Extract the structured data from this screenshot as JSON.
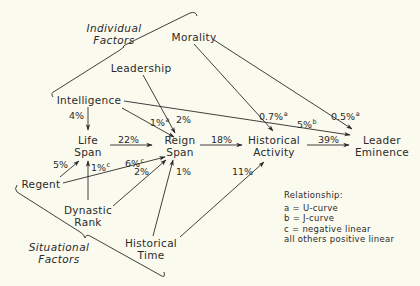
{
  "groups": {
    "individual": {
      "line1": "Individual",
      "line2": "Factors"
    },
    "situational": {
      "line1": "Situational",
      "line2": "Factors"
    }
  },
  "nodes": {
    "morality": "Morality",
    "leadership": "Leadership",
    "intelligence": "Intelligence",
    "life_span": {
      "line1": "Life",
      "line2": "Span"
    },
    "reign_span": {
      "line1": "Reign",
      "line2": "Span"
    },
    "historical_activity": {
      "line1": "Historical",
      "line2": "Activity"
    },
    "leader_eminence": {
      "line1": "Leader",
      "line2": "Eminence"
    },
    "regent": "Regent",
    "dynastic_rank": {
      "line1": "Dynastic",
      "line2": "Rank"
    },
    "historical_time": {
      "line1": "Historical",
      "line2": "Time"
    }
  },
  "paths": [
    {
      "from": "Intelligence",
      "to": "Life Span",
      "value": "4%",
      "type": ""
    },
    {
      "from": "Intelligence",
      "to": "Reign Span",
      "value": "1%",
      "type": "a"
    },
    {
      "from": "Leadership",
      "to": "Reign Span",
      "value": "2%",
      "type": ""
    },
    {
      "from": "Intelligence",
      "to": "Leader Eminence",
      "value": "5%",
      "type": "b"
    },
    {
      "from": "Morality",
      "to": "Historical Activity",
      "value": "0.7%",
      "type": "a"
    },
    {
      "from": "Morality",
      "to": "Leader Eminence",
      "value": "0.5%",
      "type": "a"
    },
    {
      "from": "Life Span",
      "to": "Reign Span",
      "value": "22%",
      "type": ""
    },
    {
      "from": "Reign Span",
      "to": "Historical Activity",
      "value": "18%",
      "type": ""
    },
    {
      "from": "Historical Activity",
      "to": "Leader Eminence",
      "value": "39%",
      "type": ""
    },
    {
      "from": "Regent",
      "to": "Life Span",
      "value": "5%",
      "type": ""
    },
    {
      "from": "Dynastic Rank",
      "to": "Life Span",
      "value": "1%",
      "type": "c"
    },
    {
      "from": "Regent",
      "to": "Reign Span",
      "value": "6%",
      "type": "c"
    },
    {
      "from": "Dynastic Rank",
      "to": "Reign Span",
      "value": "2%",
      "type": ""
    },
    {
      "from": "Historical Time",
      "to": "Reign Span",
      "value": "1%",
      "type": ""
    },
    {
      "from": "Historical Time",
      "to": "Historical Activity",
      "value": "11%",
      "type": ""
    }
  ],
  "labels": {
    "int_life": "4%",
    "int_reign": "1%",
    "int_reign_sup": "a",
    "lead_reign": "2%",
    "int_emin": "5%",
    "int_emin_sup": "b",
    "mor_act": "0.7%",
    "mor_act_sup": "a",
    "mor_emin": "0.5%",
    "mor_emin_sup": "a",
    "life_reign": "22%",
    "reign_act": "18%",
    "act_emin": "39%",
    "regent_life": "5%",
    "dyn_life": "1%",
    "dyn_life_sup": "c",
    "regent_reign": "6%",
    "regent_reign_sup": "c",
    "dyn_reign": "2%",
    "time_reign": "1%",
    "time_act": "11%"
  },
  "legend": {
    "title": "Relationship:",
    "items": [
      "a = U-curve",
      "b = J-curve",
      "c = negative linear",
      "all others positive linear"
    ]
  },
  "colors": {
    "background": "#fbfaef",
    "ink": "#2a2a2a"
  }
}
